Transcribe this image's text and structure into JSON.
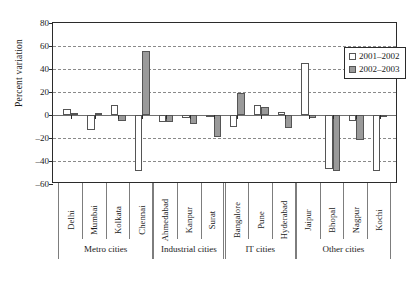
{
  "chart_data": {
    "type": "bar",
    "title": "",
    "xlabel": "",
    "ylabel": "Percent variation",
    "ylim": [
      -60,
      80
    ],
    "ytick_values": [
      80,
      60,
      40,
      20,
      0,
      -20,
      -40,
      -60
    ],
    "ytick_labels": [
      "80",
      "60",
      "40",
      "20",
      "0",
      "–20",
      "–40",
      "–60"
    ],
    "grid": "horizontal dashed at every 20 units",
    "legend_position": "top-right inside plot",
    "categories": [
      "Delhi",
      "Mumbai",
      "Kolkata",
      "Chennai",
      "Ahmedabad",
      "Kanpur",
      "Surat",
      "Bangalore",
      "Pune",
      "Hyderabad",
      "Jaipur",
      "Bhopal",
      "Nagpur",
      "Kochi"
    ],
    "series": [
      {
        "name": "2001–2002",
        "color": "#ffffff",
        "values": [
          5,
          -13,
          9,
          -49,
          -6,
          -3,
          -2,
          -10,
          9,
          3,
          45,
          -47,
          -5,
          -49
        ]
      },
      {
        "name": "2002–2003",
        "color": "#9a9a9a",
        "values": [
          2,
          2,
          -5,
          56,
          -6,
          -8,
          -19,
          19,
          7,
          -11,
          -3,
          -49,
          -22,
          -2
        ]
      }
    ],
    "groups": [
      {
        "label": "Metro cities",
        "members": [
          "Delhi",
          "Mumbai",
          "Kolkata",
          "Chennai"
        ]
      },
      {
        "label": "Industrial cities",
        "members": [
          "Ahmedabad",
          "Kanpur",
          "Surat"
        ]
      },
      {
        "label": "IT cities",
        "members": [
          "Bangalore",
          "Pune",
          "Hyderabad"
        ]
      },
      {
        "label": "Other cities",
        "members": [
          "Jaipur",
          "Bhopal",
          "Nagpur",
          "Kochi"
        ]
      }
    ]
  },
  "legend": {
    "entries": [
      {
        "label": "2001–2002",
        "swatch": "white"
      },
      {
        "label": "2002–2003",
        "swatch": "grey"
      }
    ]
  },
  "colors": {
    "series_2001_2002": "#ffffff",
    "series_2002_2003": "#9a9a9a",
    "axis": "#2b2b2b",
    "gridline": "#8a8a8a",
    "background": "#ffffff"
  }
}
